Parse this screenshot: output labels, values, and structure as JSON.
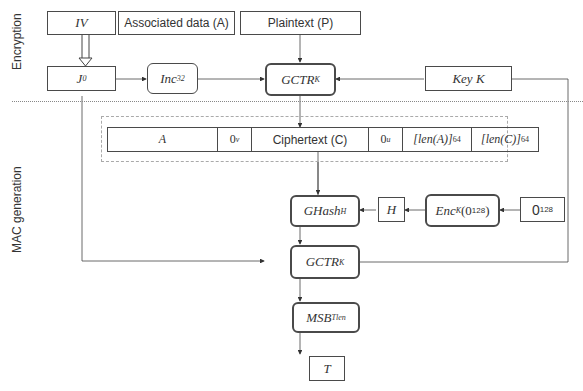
{
  "sections": {
    "encryption_label": "Encryption",
    "mac_label": "MAC generation"
  },
  "inputs": {
    "iv": "IV",
    "associated_data": "Associated data (A)",
    "plaintext": "Plaintext (P)",
    "key": "Key K"
  },
  "blocks": {
    "j0": {
      "base": "J",
      "sub": "0"
    },
    "inc": {
      "base": "Inc",
      "sub": "32"
    },
    "gctr_top": {
      "base": "GCTR",
      "sub": "K"
    },
    "ghash": {
      "base": "GHash",
      "sub": "H"
    },
    "h": "H",
    "enc": {
      "base": "Enc",
      "sub": "K",
      "arg_open": "(0",
      "arg_sup": "128",
      "arg_close": ")"
    },
    "zero128": {
      "base": "0",
      "sup": "128"
    },
    "gctr_bottom": {
      "base": "GCTR",
      "sub": "K"
    },
    "msb": {
      "base": "MSB",
      "sub": "Tlen"
    },
    "t": "T"
  },
  "concat": {
    "cells": [
      {
        "label": "A"
      },
      {
        "label": "0",
        "sup": "v"
      },
      {
        "label": "Ciphertext (C)"
      },
      {
        "label": "0",
        "sup": "u"
      },
      {
        "label": "[len(A)]",
        "sub": "64"
      },
      {
        "label": "[len(C)]",
        "sub": "64"
      }
    ]
  }
}
